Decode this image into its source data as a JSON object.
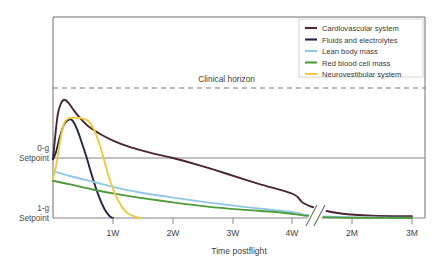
{
  "chart_data": {
    "type": "line",
    "title": "",
    "subtitle": "",
    "xlabel": "Time postflight",
    "ylabel": "",
    "grid": false,
    "legend_position": "top-right",
    "x_axis": {
      "tick_labels": [
        "1W",
        "2W",
        "3W",
        "4W",
        "2M",
        "3M"
      ],
      "tick_values": [
        7,
        14,
        21,
        28,
        60,
        90
      ],
      "axis_break_after": "4W",
      "note": "x-axis is broken between 4W and 2M"
    },
    "y_axis": {
      "tick_labels": [
        "0-g Setpoint",
        "1-g Setpoint"
      ],
      "tick_values": [
        0.0,
        -1.0
      ],
      "description": "Physiological deviation from 1-g baseline"
    },
    "annotations": [
      {
        "label": "Clinical horizon",
        "type": "dashed-horizontal-line",
        "y": 0.62
      }
    ],
    "reference_lines": [
      {
        "label": "0-g Setpoint",
        "type": "solid-horizontal-line",
        "y": 0.0,
        "color": "#808080"
      },
      {
        "label": "1-g Setpoint",
        "type": "solid-horizontal-line",
        "y": -1.0,
        "color": "#808080"
      }
    ],
    "series": [
      {
        "name": "Cardiovascular system",
        "color": "#4a2533",
        "points": [
          [
            0.0,
            -0.02
          ],
          [
            0.25,
            0.35
          ],
          [
            0.55,
            0.72
          ],
          [
            0.9,
            0.9
          ],
          [
            1.3,
            0.97
          ],
          [
            1.8,
            0.92
          ],
          [
            2.4,
            0.8
          ],
          [
            3.2,
            0.66
          ],
          [
            4.2,
            0.52
          ],
          [
            5.5,
            0.4
          ],
          [
            7.0,
            0.29
          ],
          [
            9.0,
            0.18
          ],
          [
            11.5,
            0.08
          ],
          [
            14.0,
            0.0
          ],
          [
            17.0,
            -0.12
          ],
          [
            20.0,
            -0.25
          ],
          [
            24.0,
            -0.43
          ],
          [
            28.0,
            -0.6
          ],
          [
            34.0,
            -0.75
          ],
          [
            42.0,
            -0.85
          ],
          [
            55.0,
            -0.93
          ],
          [
            70.0,
            -0.96
          ],
          [
            90.0,
            -0.97
          ]
        ]
      },
      {
        "name": "Fluids and electrolytes",
        "color": "#1e2545",
        "points": [
          [
            0.0,
            -0.02
          ],
          [
            0.35,
            0.1
          ],
          [
            0.8,
            0.35
          ],
          [
            1.3,
            0.56
          ],
          [
            1.85,
            0.64
          ],
          [
            2.3,
            0.62
          ],
          [
            2.8,
            0.48
          ],
          [
            3.3,
            0.28
          ],
          [
            3.9,
            0.02
          ],
          [
            4.6,
            -0.32
          ],
          [
            5.3,
            -0.62
          ],
          [
            6.0,
            -0.85
          ],
          [
            6.6,
            -0.97
          ],
          [
            7.0,
            -1.0
          ]
        ]
      },
      {
        "name": "Lean body mass",
        "color": "#8fc7e8",
        "points": [
          [
            0.0,
            -0.22
          ],
          [
            2.0,
            -0.3
          ],
          [
            4.5,
            -0.39
          ],
          [
            7.0,
            -0.48
          ],
          [
            10.0,
            -0.57
          ],
          [
            14.0,
            -0.66
          ],
          [
            18.0,
            -0.74
          ],
          [
            22.0,
            -0.81
          ],
          [
            26.0,
            -0.87
          ],
          [
            30.0,
            -0.91
          ],
          [
            36.0,
            -0.95
          ],
          [
            45.0,
            -0.975
          ],
          [
            60.0,
            -0.99
          ],
          [
            90.0,
            -0.995
          ]
        ]
      },
      {
        "name": "Red blood cell mass",
        "color": "#4e9b3c",
        "points": [
          [
            0.0,
            -0.38
          ],
          [
            2.0,
            -0.44
          ],
          [
            4.5,
            -0.52
          ],
          [
            7.0,
            -0.59
          ],
          [
            10.0,
            -0.66
          ],
          [
            14.0,
            -0.74
          ],
          [
            18.0,
            -0.81
          ],
          [
            22.0,
            -0.86
          ],
          [
            26.0,
            -0.9
          ],
          [
            30.0,
            -0.94
          ],
          [
            36.0,
            -0.965
          ],
          [
            45.0,
            -0.985
          ],
          [
            60.0,
            -0.995
          ],
          [
            90.0,
            -1.0
          ]
        ]
      },
      {
        "name": "Neurovestibular system",
        "color": "#edcb3f",
        "points": [
          [
            0.0,
            -0.35
          ],
          [
            0.4,
            -0.1
          ],
          [
            0.85,
            0.3
          ],
          [
            1.3,
            0.58
          ],
          [
            1.8,
            0.66
          ],
          [
            2.6,
            0.67
          ],
          [
            3.4,
            0.66
          ],
          [
            4.1,
            0.62
          ],
          [
            4.7,
            0.5
          ],
          [
            5.3,
            0.28
          ],
          [
            5.9,
            0.0
          ],
          [
            6.6,
            -0.35
          ],
          [
            7.4,
            -0.65
          ],
          [
            8.4,
            -0.88
          ],
          [
            9.4,
            -0.97
          ],
          [
            10.2,
            -1.0
          ]
        ]
      }
    ]
  },
  "legend": {
    "items": [
      {
        "label": "Cardiovascular system",
        "color": "#4a2533"
      },
      {
        "label": "Fluids and electrolytes",
        "color": "#1e2545"
      },
      {
        "label": "Lean body mass",
        "color": "#8fc7e8"
      },
      {
        "label": "Red blood cell mass",
        "color": "#4e9b3c"
      },
      {
        "label": "Neurovestibular system",
        "color": "#edcb3f"
      }
    ]
  },
  "labels": {
    "clinical_horizon": "Clinical horizon",
    "setpoint_0g_line1": "0-g",
    "setpoint_0g_line2": "Setpoint",
    "setpoint_1g_line1": "1-g",
    "setpoint_1g_line2": "Setpoint",
    "x_axis_title": "Time postflight"
  },
  "colors": {
    "frame": "#7a7a7a",
    "axis": "#8a8a8a",
    "dashed": "#777777",
    "background": "#ffffff"
  }
}
